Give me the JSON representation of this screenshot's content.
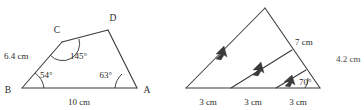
{
  "figures": [
    {
      "id": "quadrilateral-bcda",
      "name": "Quadrilateral BCDA",
      "vertices": {
        "b": "B",
        "c": "C",
        "d": "D",
        "a": "A"
      },
      "side_labels": {
        "bc": "6.4 cm",
        "ba": "10 cm"
      },
      "angle_labels": {
        "at_b": "54°",
        "at_c": "145°",
        "at_a": "63°"
      }
    },
    {
      "id": "triangle-parallel-lines",
      "name": "Triangle with parallel transversals",
      "base_segments": [
        "3 cm",
        "3 cm",
        "3 cm"
      ],
      "side_label": "7 cm",
      "angle_labels": {
        "at_base_right": "70°"
      },
      "edge_label": "4.2 cm"
    }
  ],
  "colors": {
    "stroke": "#3a3a3a",
    "text": "#2b2b2b",
    "background": "#ffffff"
  }
}
